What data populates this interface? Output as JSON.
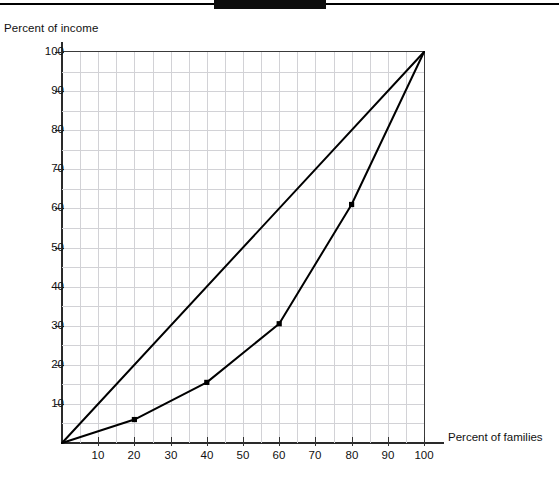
{
  "page": {
    "top_bar": {
      "rule_color": "#000000",
      "block_color": "#0d0d0d"
    }
  },
  "chart_data": {
    "type": "line",
    "title": "",
    "xlabel": "Percent of families",
    "ylabel": "Percent of income",
    "xlim": [
      0,
      100
    ],
    "ylim": [
      0,
      100
    ],
    "grid": true,
    "grid_step": 5,
    "legend": "none",
    "xticks": [
      10,
      20,
      30,
      40,
      50,
      60,
      70,
      80,
      90,
      100
    ],
    "xtick_labels": [
      "10",
      "20",
      "30",
      "40",
      "50",
      "60",
      "70",
      "80",
      "90",
      "100"
    ],
    "yticks": [
      10,
      20,
      30,
      40,
      50,
      60,
      70,
      80,
      90,
      100
    ],
    "ytick_labels": [
      "10",
      "20",
      "30",
      "40",
      "50",
      "60",
      "70",
      "80",
      "90",
      "100"
    ],
    "series": [
      {
        "name": "Line of equality",
        "color": "#000000",
        "markers": false,
        "x": [
          0,
          100
        ],
        "y": [
          0,
          100
        ]
      },
      {
        "name": "Lorenz curve",
        "color": "#000000",
        "markers": true,
        "x": [
          0,
          20,
          40,
          60,
          80,
          100
        ],
        "y": [
          0,
          6,
          15.5,
          30.5,
          61,
          100
        ]
      }
    ]
  }
}
